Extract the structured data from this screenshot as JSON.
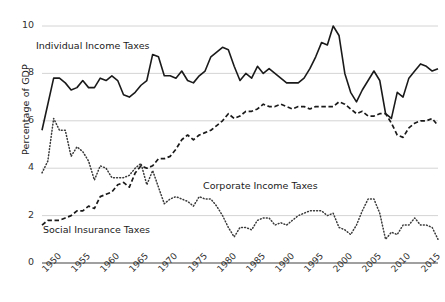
{
  "axes": {
    "ylabel": "Percentage of GDP",
    "yticks": [
      0,
      2,
      4,
      6,
      8,
      10
    ],
    "ytick_labels": [
      "0",
      "2",
      "4",
      "6",
      "8",
      "10"
    ],
    "xtick_labels": [
      "1950",
      "1955",
      "1960",
      "1965",
      "1970",
      "1975",
      "1980",
      "1985",
      "1990",
      "1995",
      "2000",
      "2005",
      "2010",
      "2015"
    ],
    "xticks": [
      1950,
      1955,
      1960,
      1965,
      1970,
      1975,
      1980,
      1985,
      1990,
      1995,
      2000,
      2005,
      2010,
      2015
    ],
    "xlabel": "",
    "ylim": [
      0,
      10
    ],
    "xlim": [
      1950,
      2018
    ],
    "grid": "horizontal",
    "gridline_color": "#cfcfcf",
    "axisline_color": "#808080"
  },
  "labels": {
    "individual": "Individual Income Taxes",
    "corporate": "Corporate Income Taxes",
    "social": "Social Insurance Taxes"
  },
  "chart_data": {
    "type": "line",
    "title": "",
    "xlabel": "",
    "ylabel": "Percentage of GDP",
    "xlim": [
      1950,
      2018
    ],
    "ylim": [
      0,
      10
    ],
    "grid": true,
    "legend_position": "inline-annotations",
    "x": [
      1950,
      1951,
      1952,
      1953,
      1954,
      1955,
      1956,
      1957,
      1958,
      1959,
      1960,
      1961,
      1962,
      1963,
      1964,
      1965,
      1966,
      1967,
      1968,
      1969,
      1970,
      1971,
      1972,
      1973,
      1974,
      1975,
      1976,
      1977,
      1978,
      1979,
      1980,
      1981,
      1982,
      1983,
      1984,
      1985,
      1986,
      1987,
      1988,
      1989,
      1990,
      1991,
      1992,
      1993,
      1994,
      1995,
      1996,
      1997,
      1998,
      1999,
      2000,
      2001,
      2002,
      2003,
      2004,
      2005,
      2006,
      2007,
      2008,
      2009,
      2010,
      2011,
      2012,
      2013,
      2014,
      2015,
      2016,
      2017,
      2018
    ],
    "series": [
      {
        "name": "Individual Income Taxes",
        "style": "solid",
        "color": "#1a1a1a",
        "values": [
          5.6,
          6.7,
          7.8,
          7.8,
          7.6,
          7.3,
          7.4,
          7.7,
          7.4,
          7.4,
          7.8,
          7.7,
          7.9,
          7.7,
          7.1,
          7.0,
          7.2,
          7.5,
          7.7,
          8.8,
          8.7,
          7.9,
          7.9,
          7.8,
          8.1,
          7.7,
          7.6,
          7.9,
          8.1,
          8.7,
          8.9,
          9.1,
          9.0,
          8.3,
          7.7,
          8.0,
          7.8,
          8.3,
          8.0,
          8.2,
          8.0,
          7.8,
          7.6,
          7.6,
          7.6,
          7.8,
          8.2,
          8.7,
          9.3,
          9.2,
          10.0,
          9.6,
          8.0,
          7.2,
          6.8,
          7.3,
          7.7,
          8.1,
          7.7,
          6.3,
          6.1,
          7.2,
          7.0,
          7.8,
          8.1,
          8.4,
          8.3,
          8.1,
          8.2
        ]
      },
      {
        "name": "Corporate Income Taxes",
        "style": "dotted",
        "color": "#3a3a3a",
        "values": [
          3.8,
          4.3,
          6.1,
          5.6,
          5.6,
          4.5,
          4.9,
          4.7,
          4.3,
          3.5,
          4.1,
          4.0,
          3.6,
          3.6,
          3.6,
          3.7,
          4.0,
          4.2,
          3.3,
          3.9,
          3.2,
          2.5,
          2.7,
          2.8,
          2.7,
          2.6,
          2.4,
          2.8,
          2.7,
          2.7,
          2.4,
          2.0,
          1.5,
          1.1,
          1.5,
          1.5,
          1.4,
          1.8,
          1.9,
          1.9,
          1.6,
          1.7,
          1.6,
          1.8,
          2.0,
          2.1,
          2.2,
          2.2,
          2.2,
          2.0,
          2.1,
          1.5,
          1.4,
          1.2,
          1.6,
          2.2,
          2.7,
          2.7,
          2.1,
          1.0,
          1.3,
          1.2,
          1.6,
          1.6,
          1.9,
          1.6,
          1.6,
          1.5,
          1.0
        ]
      },
      {
        "name": "Social Insurance Taxes",
        "style": "dashed",
        "color": "#1a1a1a",
        "values": [
          1.6,
          1.8,
          1.8,
          1.8,
          1.9,
          2.0,
          2.2,
          2.2,
          2.4,
          2.3,
          2.8,
          2.9,
          3.0,
          3.3,
          3.4,
          3.2,
          3.8,
          4.1,
          4.0,
          4.1,
          4.4,
          4.4,
          4.5,
          4.8,
          5.2,
          5.4,
          5.2,
          5.4,
          5.5,
          5.6,
          5.8,
          6.0,
          6.3,
          6.1,
          6.2,
          6.4,
          6.4,
          6.5,
          6.7,
          6.6,
          6.6,
          6.7,
          6.6,
          6.5,
          6.6,
          6.6,
          6.5,
          6.6,
          6.6,
          6.6,
          6.6,
          6.8,
          6.7,
          6.5,
          6.3,
          6.4,
          6.2,
          6.2,
          6.3,
          6.3,
          5.9,
          5.4,
          5.3,
          5.7,
          5.9,
          6.0,
          6.0,
          6.1,
          5.8
        ]
      }
    ]
  }
}
